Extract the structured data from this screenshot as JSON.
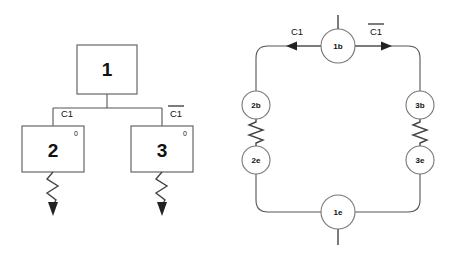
{
  "figure": {
    "background_color": "#ffffff",
    "line_color": "#555555",
    "text_color": "#111111"
  },
  "left_diagram": {
    "name": "block-hierarchy-tree",
    "root_block": {
      "label": "1",
      "x": 77,
      "y": 45,
      "w": 60,
      "h": 49
    },
    "child_blocks": [
      {
        "label": "2",
        "corner_marker": "0",
        "x": 22,
        "y": 126,
        "w": 62,
        "h": 46
      },
      {
        "label": "3",
        "corner_marker": "0",
        "x": 131,
        "y": 126,
        "w": 62,
        "h": 46
      }
    ],
    "branch_labels": [
      {
        "text": "C1",
        "overline": false,
        "x": 67,
        "y": 114
      },
      {
        "text": "C1",
        "overline": true,
        "x": 176,
        "y": 114
      }
    ],
    "bus_y": 108,
    "outputs": [
      {
        "name": "zigzag-arrow-left",
        "x": 53,
        "y_top": 172,
        "y_tip": 214
      },
      {
        "name": "zigzag-arrow-right",
        "x": 162,
        "y_top": 172,
        "y_tip": 214
      }
    ]
  },
  "right_diagram": {
    "name": "node-loop-circuit",
    "loop": {
      "left_x": 256,
      "right_x": 420,
      "top_y": 46,
      "bottom_y": 212,
      "corner_radius": 12
    },
    "nodes": [
      {
        "label": "1b",
        "cx": 338,
        "cy": 46,
        "r": 17,
        "stub": "up"
      },
      {
        "label": "2b",
        "cx": 256,
        "cy": 105,
        "r": 14,
        "stub": "none"
      },
      {
        "label": "2e",
        "cx": 256,
        "cy": 160,
        "r": 14,
        "stub": "none"
      },
      {
        "label": "3b",
        "cx": 420,
        "cy": 105,
        "r": 14,
        "stub": "none"
      },
      {
        "label": "3e",
        "cx": 420,
        "cy": 160,
        "r": 14,
        "stub": "none"
      },
      {
        "label": "1e",
        "cx": 338,
        "cy": 212,
        "r": 17,
        "stub": "down"
      }
    ],
    "resistors": [
      {
        "name": "resistor-left",
        "x": 256,
        "y_top": 119,
        "y_bottom": 146
      },
      {
        "name": "resistor-right",
        "x": 420,
        "y_top": 119,
        "y_bottom": 146
      }
    ],
    "arrows": [
      {
        "name": "arrow-left",
        "direction": "left",
        "label": "C1",
        "overline": false,
        "label_x": 297,
        "label_y": 32,
        "tip_x": 289,
        "tail_x": 321,
        "y": 46
      },
      {
        "name": "arrow-right",
        "direction": "right",
        "label": "C1",
        "overline": true,
        "label_x": 376,
        "label_y": 32,
        "tip_x": 390,
        "tail_x": 355,
        "y": 46
      }
    ]
  }
}
